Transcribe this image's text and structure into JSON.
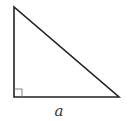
{
  "diagram": {
    "type": "right-triangle",
    "vertices": {
      "top": [
        14,
        7
      ],
      "right_angle": [
        14,
        97
      ],
      "bottom_right": [
        119,
        97
      ]
    },
    "right_angle_marker_size": 8,
    "stroke_color": "#222222",
    "marker_color": "#777777",
    "labels": {
      "base": "a"
    }
  }
}
